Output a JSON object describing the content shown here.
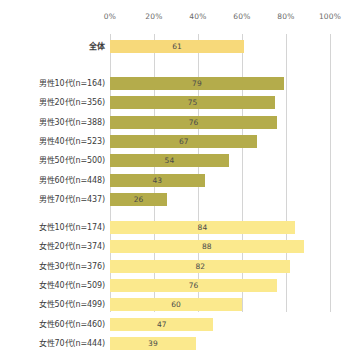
{
  "chart_data": {
    "type": "bar",
    "orientation": "horizontal",
    "title": "",
    "xlabel": "",
    "ylabel": "",
    "xlim": [
      0,
      100
    ],
    "grid": true,
    "legend": "none",
    "tick_labels": [
      "0%",
      "20%",
      "40%",
      "60%",
      "80%",
      "100%"
    ],
    "tick_values": [
      0,
      20,
      40,
      60,
      80,
      100
    ],
    "categories": [
      "全体",
      "男性10代(n=164)",
      "男性20代(n=356)",
      "男性30代(n=388)",
      "男性40代(n=523)",
      "男性50代(n=500)",
      "男性60代(n=448)",
      "男性70代(n=437)",
      "女性10代(n=174)",
      "女性20代(n=374)",
      "女性30代(n=376)",
      "女性40代(n=509)",
      "女性50代(n=499)",
      "女性60代(n=460)",
      "女性70代(n=444)"
    ],
    "values": [
      61,
      79,
      75,
      76,
      67,
      54,
      43,
      26,
      84,
      88,
      82,
      76,
      60,
      47,
      39
    ],
    "bars": [
      {
        "label": "全体",
        "value": 61,
        "group": "total",
        "color": "#f7d97a"
      },
      {
        "label": "男性10代(n=164)",
        "value": 79,
        "group": "male",
        "color": "#b4ac4b"
      },
      {
        "label": "男性20代(n=356)",
        "value": 75,
        "group": "male",
        "color": "#b4ac4b"
      },
      {
        "label": "男性30代(n=388)",
        "value": 76,
        "group": "male",
        "color": "#b4ac4b"
      },
      {
        "label": "男性40代(n=523)",
        "value": 67,
        "group": "male",
        "color": "#b4ac4b"
      },
      {
        "label": "男性50代(n=500)",
        "value": 54,
        "group": "male",
        "color": "#b4ac4b"
      },
      {
        "label": "男性60代(n=448)",
        "value": 43,
        "group": "male",
        "color": "#b4ac4b"
      },
      {
        "label": "男性70代(n=437)",
        "value": 26,
        "group": "male",
        "color": "#b4ac4b"
      },
      {
        "label": "女性10代(n=174)",
        "value": 84,
        "group": "female",
        "color": "#fbe98d"
      },
      {
        "label": "女性20代(n=374)",
        "value": 88,
        "group": "female",
        "color": "#fbe98d"
      },
      {
        "label": "女性30代(n=376)",
        "value": 82,
        "group": "female",
        "color": "#fbe98d"
      },
      {
        "label": "女性40代(n=509)",
        "value": 76,
        "group": "female",
        "color": "#fbe98d"
      },
      {
        "label": "女性50代(n=499)",
        "value": 60,
        "group": "female",
        "color": "#fbe98d"
      },
      {
        "label": "女性60代(n=460)",
        "value": 47,
        "group": "female",
        "color": "#fbe98d"
      },
      {
        "label": "女性70代(n=444)",
        "value": 39,
        "group": "female",
        "color": "#fbe98d"
      }
    ],
    "colors": {
      "total": "#f7d97a",
      "male": "#b4ac4b",
      "female": "#fbe98d",
      "gridline": "#d4d4d4",
      "text": "#3b3b3b",
      "tick_text": "#6b6b6b",
      "background": "#ffffff"
    }
  },
  "layout": {
    "row_height": 13,
    "row_step": 19.3,
    "group_gap": 9,
    "plot_left": 110,
    "plot_width": 220,
    "plot_top": 34
  }
}
